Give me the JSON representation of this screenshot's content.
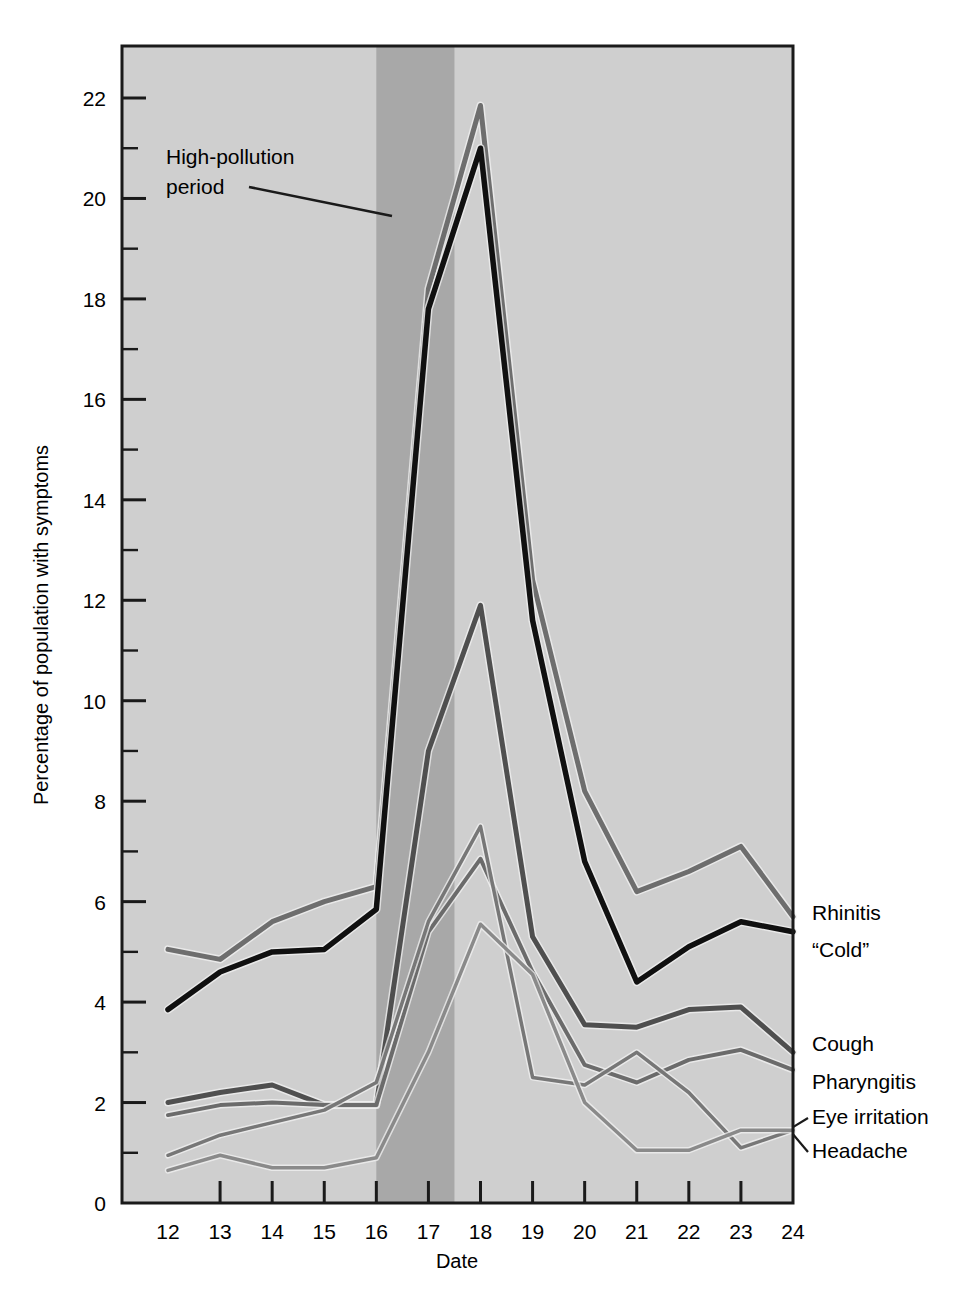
{
  "figure": {
    "background": "#ffffff",
    "plot_background": "#cfcfcf",
    "band_color": "#a8a8a8",
    "frame_color": "#1a1a1a"
  },
  "annotation": {
    "line1": "High-pollution",
    "line2": "period",
    "target_note": "leader line points to shaded band"
  },
  "chart_data": {
    "type": "line",
    "title": "",
    "xlabel": "Date",
    "ylabel": "Percentage of population with symptoms",
    "xlim": [
      12,
      24
    ],
    "ylim": [
      0,
      23
    ],
    "xticks": [
      "12",
      "13",
      "14",
      "15",
      "16",
      "17",
      "18",
      "19",
      "20",
      "21",
      "22",
      "23",
      "24"
    ],
    "yticks": [
      "0",
      "2",
      "4",
      "6",
      "8",
      "10",
      "12",
      "14",
      "16",
      "18",
      "20",
      "22"
    ],
    "ytick_minor_step": 1,
    "grid": false,
    "legend_position": "right-inline",
    "shaded_region": {
      "label": "High-pollution period",
      "x_start": 16,
      "x_end": 17.5,
      "color": "#a8a8a8"
    },
    "x": [
      12,
      13,
      14,
      15,
      16,
      17,
      18,
      19,
      20,
      21,
      22,
      23,
      24
    ],
    "series": [
      {
        "name": "Rhinitis",
        "color": "#6e6e6e",
        "width": 5,
        "values": [
          5.05,
          4.85,
          5.6,
          6.0,
          6.3,
          18.2,
          21.85,
          12.4,
          8.2,
          6.2,
          6.6,
          7.1,
          5.7
        ]
      },
      {
        "name": "“Cold”",
        "color": "#101010",
        "width": 5.5,
        "values": [
          3.85,
          4.6,
          5.0,
          5.05,
          5.85,
          17.8,
          21.0,
          11.6,
          6.8,
          4.4,
          5.1,
          5.6,
          5.4
        ]
      },
      {
        "name": "Cough",
        "color": "#4f4f4f",
        "width": 5,
        "values": [
          2.0,
          2.2,
          2.35,
          1.95,
          1.95,
          9.0,
          11.9,
          5.3,
          3.55,
          3.5,
          3.85,
          3.9,
          3.0
        ]
      },
      {
        "name": "Pharyngitis",
        "color": "#6b6b6b",
        "width": 4,
        "values": [
          1.75,
          1.95,
          2.0,
          1.95,
          1.95,
          5.4,
          6.85,
          4.6,
          2.75,
          2.4,
          2.85,
          3.05,
          2.65
        ]
      },
      {
        "name": "Eye irritation",
        "color": "#777777",
        "width": 3.5,
        "values": [
          0.95,
          1.35,
          1.6,
          1.85,
          2.4,
          5.6,
          7.5,
          2.5,
          2.35,
          3.0,
          2.2,
          1.1,
          1.45
        ]
      },
      {
        "name": "Headache",
        "color": "#8a8a8a",
        "width": 3.5,
        "values": [
          0.65,
          0.95,
          0.7,
          0.7,
          0.9,
          3.0,
          5.55,
          4.55,
          2.0,
          1.05,
          1.05,
          1.45,
          1.45
        ]
      }
    ],
    "legend_entries": [
      {
        "label": "Rhinitis",
        "y_value": 5.7
      },
      {
        "label": "“Cold”",
        "y_value": 5.4
      },
      {
        "label": "Cough",
        "y_value": 3.0
      },
      {
        "label": "Pharyngitis",
        "y_value": 2.65
      },
      {
        "label": "Eye irritation",
        "y_value": 1.45
      },
      {
        "label": "Headache",
        "y_value": 1.45
      }
    ]
  }
}
